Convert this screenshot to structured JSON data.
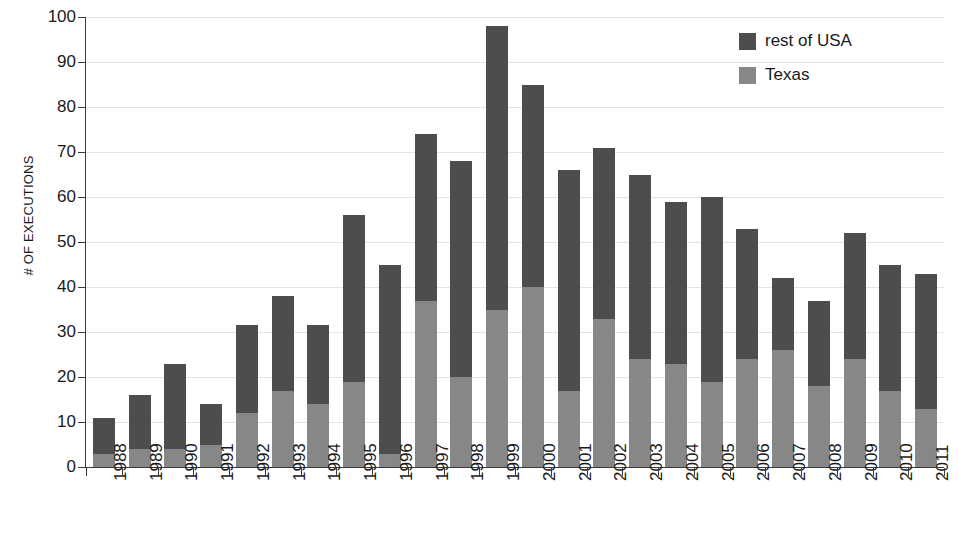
{
  "chart_data": {
    "type": "bar",
    "stacked": true,
    "title": "",
    "subtitle": "",
    "xlabel": "",
    "ylabel": "# OF EXECUTIONS",
    "ylim": [
      0,
      100
    ],
    "ytick_step": 10,
    "yticks": [
      0,
      10,
      20,
      30,
      40,
      50,
      60,
      70,
      80,
      90,
      100
    ],
    "ytick_labels": [
      "0",
      "10",
      "20",
      "30",
      "40",
      "50",
      "60",
      "70",
      "80",
      "90",
      "100"
    ],
    "grid": true,
    "grid_axis": "y",
    "legend_position": "top-right",
    "categories": [
      "1988",
      "1989",
      "1990",
      "1991",
      "1992",
      "1993",
      "1994",
      "1995",
      "1996",
      "1997",
      "1998",
      "1999",
      "2000",
      "2001",
      "2002",
      "2003",
      "2004",
      "2005",
      "2006",
      "2007",
      "2008",
      "2009",
      "2010",
      "2011"
    ],
    "series": [
      {
        "name": "Texas",
        "color": "#878787",
        "values": [
          3,
          4,
          4,
          5,
          12,
          17,
          14,
          19,
          3,
          37,
          20,
          35,
          40,
          17,
          33,
          24,
          23,
          19,
          24,
          26,
          18,
          24,
          17,
          13
        ]
      },
      {
        "name": "rest of USA",
        "color": "#4d4d4d",
        "values": [
          8,
          12,
          19,
          9,
          19.5,
          21,
          17.5,
          37,
          42,
          37,
          48,
          63,
          45,
          49,
          38,
          41,
          36,
          41,
          29,
          16,
          19,
          28,
          28,
          30
        ]
      }
    ],
    "totals": [
      11,
      16,
      23,
      14,
      31.5,
      38,
      31.5,
      56,
      45,
      74,
      68,
      98,
      85,
      66,
      71,
      65,
      59,
      60,
      53,
      42,
      37,
      52,
      45,
      43
    ]
  },
  "legend": {
    "entries": [
      {
        "label": "rest of USA",
        "color": "#4d4d4d",
        "swatch_name": "legend-swatch-rest-of-usa"
      },
      {
        "label": "Texas",
        "color": "#878787",
        "swatch_name": "legend-swatch-texas"
      }
    ]
  },
  "colors": {
    "texas": "#878787",
    "rest_of_usa": "#4d4d4d",
    "axis": "#3a3a3a",
    "grid": "#e3e3e3",
    "background": "#ffffff",
    "text": "#1a1a1a"
  }
}
